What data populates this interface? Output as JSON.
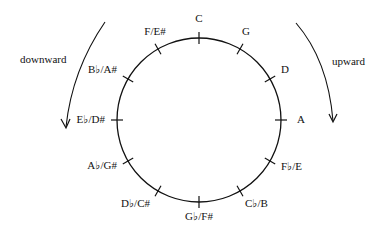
{
  "diagram": {
    "circle": {
      "cx": 199,
      "cy": 120,
      "r": 82,
      "stroke": "#111111"
    },
    "notes": [
      {
        "label": "C",
        "angle": 0,
        "lx": 199,
        "ly": 22,
        "anchor": "middle"
      },
      {
        "label": "G",
        "angle": 30,
        "lx": 246,
        "ly": 35,
        "anchor": "middle"
      },
      {
        "label": "D",
        "angle": 60,
        "lx": 285,
        "ly": 73,
        "anchor": "middle"
      },
      {
        "label": "A",
        "angle": 90,
        "lx": 297,
        "ly": 123,
        "anchor": "start"
      },
      {
        "label": "F♭/E",
        "angle": 120,
        "lx": 281,
        "ly": 170,
        "anchor": "start"
      },
      {
        "label": "C♭/B",
        "angle": 150,
        "lx": 245,
        "ly": 207,
        "anchor": "start"
      },
      {
        "label": "G♭/F#",
        "angle": 180,
        "lx": 199,
        "ly": 220,
        "anchor": "middle"
      },
      {
        "label": "D♭/C#",
        "angle": 210,
        "lx": 150,
        "ly": 207,
        "anchor": "end"
      },
      {
        "label": "A♭/G#",
        "angle": 240,
        "lx": 117,
        "ly": 169,
        "anchor": "end"
      },
      {
        "label": "E♭/D#",
        "angle": 270,
        "lx": 105,
        "ly": 123,
        "anchor": "end"
      },
      {
        "label": "B♭/A#",
        "angle": 300,
        "lx": 117,
        "ly": 73,
        "anchor": "end"
      },
      {
        "label": "F/E#",
        "angle": 330,
        "lx": 155,
        "ly": 35,
        "anchor": "middle"
      }
    ],
    "arrows": {
      "downward": {
        "label": "downward",
        "direction": "counter-clockwise"
      },
      "upward": {
        "label": "upward",
        "direction": "clockwise"
      }
    }
  }
}
